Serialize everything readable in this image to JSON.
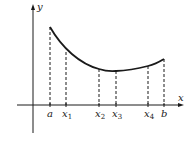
{
  "diagram": {
    "type": "function-graph-partition",
    "axes": {
      "x_label": "x",
      "y_label": "y"
    },
    "partition_points": [
      {
        "label": "a",
        "sub": "",
        "px": 50,
        "curve_y": 27
      },
      {
        "label": "x",
        "sub": "1",
        "px": 66,
        "curve_y": 52
      },
      {
        "label": "x",
        "sub": "2",
        "px": 99,
        "curve_y": 69
      },
      {
        "label": "x",
        "sub": "3",
        "px": 116,
        "curve_y": 71
      },
      {
        "label": "x",
        "sub": "4",
        "px": 148,
        "curve_y": 66
      },
      {
        "label": "b",
        "sub": "",
        "px": 164,
        "curve_y": 59
      }
    ],
    "colors": {
      "ink": "#1a1a1a",
      "background": "#ffffff"
    }
  }
}
